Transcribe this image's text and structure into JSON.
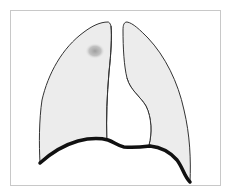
{
  "diagram": {
    "frame": {
      "x": 10,
      "y": 10,
      "width": 210,
      "height": 175,
      "stroke": "#c8c8c8",
      "fill": "#ffffff"
    },
    "colors": {
      "lung_fill": "#ececec",
      "lung_outline": "#333333",
      "diaphragm": "#111111",
      "nodule": "#a8a8a8",
      "background": "#ffffff"
    },
    "parts": [
      {
        "id": "left-lung",
        "label": "Left lung (viewer's left)"
      },
      {
        "id": "right-lung",
        "label": "Right lung (viewer's right) with cardiac notch"
      },
      {
        "id": "diaphragm",
        "label": "Diaphragm outline (thick line)"
      },
      {
        "id": "nodule",
        "label": "Opacity / nodule in upper lobe",
        "cx": 95,
        "cy": 51,
        "rx": 9,
        "ry": 7
      }
    ]
  }
}
